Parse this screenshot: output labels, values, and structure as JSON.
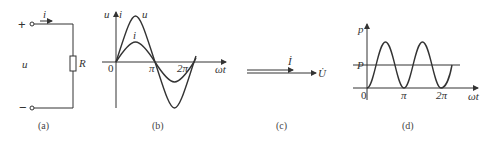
{
  "panels": {
    "a": {
      "caption": "(a)",
      "plus": "+",
      "minus": "−",
      "voltage_label": "u",
      "current_label": "i",
      "resistor_label": "R"
    },
    "b": {
      "caption": "(b)",
      "y_label_u": "u",
      "y_label_i": "i",
      "origin": "0",
      "tick_pi": "π",
      "tick_2pi": "2π",
      "x_label": "ωt",
      "curve_u_label": "u",
      "curve_i_label": "i"
    },
    "c": {
      "caption": "(c)",
      "phasor_I": "İ",
      "phasor_U": "U̇"
    },
    "d": {
      "caption": "(d)",
      "y_label": "p",
      "avg_label": "P",
      "origin": "0",
      "tick_pi": "π",
      "tick_2pi": "2π",
      "x_label": "ωt"
    }
  },
  "colors": {
    "line": "#333333",
    "background": "#ffffff"
  }
}
